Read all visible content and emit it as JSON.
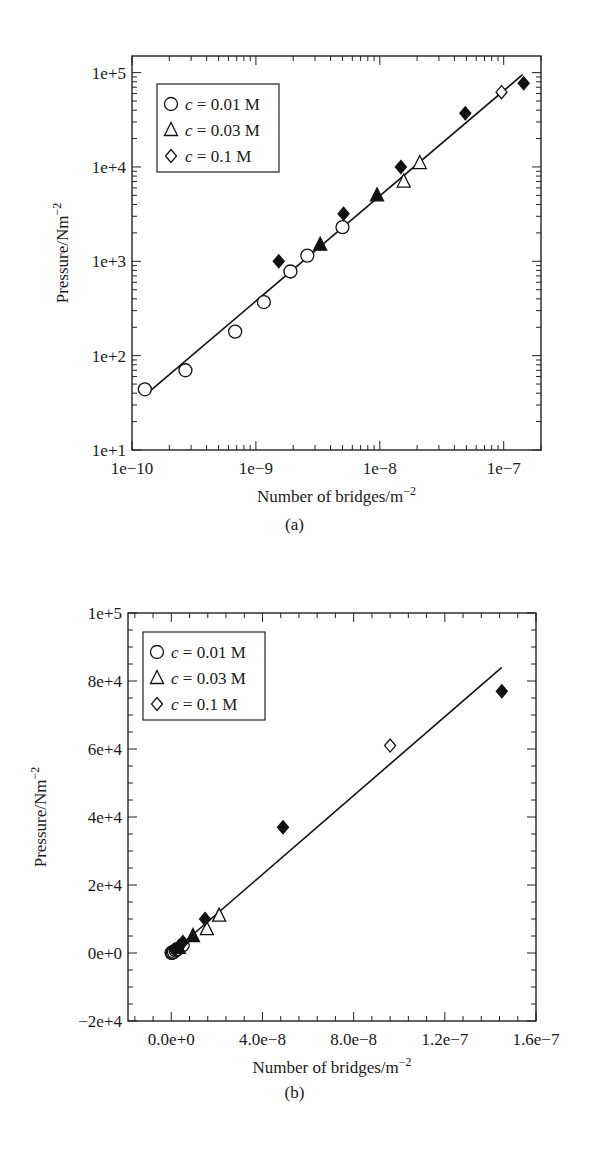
{
  "chart_data": [
    {
      "id": "a",
      "caption": "(a)",
      "type": "scatter",
      "xscale": "log",
      "yscale": "log",
      "xlabel": "Number of bridges/m",
      "xlabel_sup": "−2",
      "ylabel": "Pressure/Nm",
      "ylabel_sup": "−2",
      "xlim": [
        1e-10,
        2e-07
      ],
      "ylim": [
        10,
        150000
      ],
      "xticks": [
        {
          "value": 1e-10,
          "label": "1e−10"
        },
        {
          "value": 1e-09,
          "label": "1e−9"
        },
        {
          "value": 1e-08,
          "label": "1e−8"
        },
        {
          "value": 1e-07,
          "label": "1e−7"
        }
      ],
      "yticks": [
        {
          "value": 10,
          "label": "1e+1"
        },
        {
          "value": 100,
          "label": "1e+2"
        },
        {
          "value": 1000,
          "label": "1e+3"
        },
        {
          "value": 10000,
          "label": "1e+4"
        },
        {
          "value": 100000,
          "label": "1e+5"
        }
      ],
      "grid": false,
      "legend_position": "upper left",
      "legend": [
        {
          "marker": "circle-open",
          "label_italic": "c",
          "label": " = 0.01 M"
        },
        {
          "marker": "triangle-open",
          "label_italic": "c",
          "label": " = 0.03 M"
        },
        {
          "marker": "diamond-open",
          "label_italic": "c",
          "label": " = 0.1 M"
        }
      ],
      "series": [
        {
          "name": "c = 0.01 M",
          "marker": "circle-open",
          "x": [
            1.27e-10,
            2.7e-10,
            6.8e-10,
            1.16e-09,
            1.9e-09,
            2.6e-09,
            5e-09
          ],
          "y": [
            44,
            70,
            180,
            370,
            780,
            1150,
            2300
          ]
        },
        {
          "name": "c = 0.03 M",
          "marker": "triangle-open",
          "x": [
            1.56e-08,
            2.1e-08
          ],
          "y": [
            7000,
            11000
          ]
        },
        {
          "name": "c = 0.03 M (filled)",
          "marker": "triangle-filled",
          "x": [
            3.3e-09,
            9.5e-09
          ],
          "y": [
            1500,
            5000
          ]
        },
        {
          "name": "c = 0.1 M",
          "marker": "diamond-open",
          "x": [
            9.6e-08
          ],
          "y": [
            62000
          ]
        },
        {
          "name": "c = 0.1 M (filled)",
          "marker": "diamond-filled",
          "x": [
            1.53e-09,
            5.1e-09,
            1.48e-08,
            4.9e-08,
            1.45e-07
          ],
          "y": [
            1000,
            3200,
            10000,
            37000,
            77000
          ]
        }
      ],
      "fit_line": {
        "x": [
          1.27e-10,
          1.42e-07
        ],
        "y": [
          38,
          95000
        ]
      }
    },
    {
      "id": "b",
      "caption": "(b)",
      "type": "scatter",
      "xscale": "linear",
      "yscale": "linear",
      "xlabel": "Number of bridges/m",
      "xlabel_sup": "−2",
      "ylabel": "Pressure/Nm",
      "ylabel_sup": "−2",
      "xlim": [
        -1.9e-08,
        1.6e-07
      ],
      "ylim": [
        -20000,
        100000
      ],
      "xticks": [
        {
          "value": 0,
          "label": "0.0e+0"
        },
        {
          "value": 4e-08,
          "label": "4.0e−8"
        },
        {
          "value": 8e-08,
          "label": "8.0e−8"
        },
        {
          "value": 1.2e-07,
          "label": "1.2e−7"
        },
        {
          "value": 1.6e-07,
          "label": "1.6e−7"
        }
      ],
      "yticks": [
        {
          "value": -20000,
          "label": "−2e+4"
        },
        {
          "value": 0,
          "label": "0e+0"
        },
        {
          "value": 20000,
          "label": "2e+4"
        },
        {
          "value": 40000,
          "label": "4e+4"
        },
        {
          "value": 60000,
          "label": "6e+4"
        },
        {
          "value": 80000,
          "label": "8e+4"
        },
        {
          "value": 100000,
          "label": "1e+5"
        }
      ],
      "grid": false,
      "legend_position": "upper left",
      "legend": [
        {
          "marker": "circle-open",
          "label_italic": "c",
          "label": " = 0.01 M"
        },
        {
          "marker": "triangle-open",
          "label_italic": "c",
          "label": " = 0.03 M"
        },
        {
          "marker": "diamond-open",
          "label_italic": "c",
          "label": " = 0.1 M"
        }
      ],
      "series": [
        {
          "name": "c = 0.01 M",
          "marker": "circle-open",
          "x": [
            1.27e-10,
            2.7e-10,
            6.8e-10,
            1.16e-09,
            1.9e-09,
            2.6e-09,
            5e-09
          ],
          "y": [
            44,
            70,
            180,
            370,
            780,
            1150,
            2300
          ]
        },
        {
          "name": "c = 0.03 M",
          "marker": "triangle-open",
          "x": [
            1.56e-08,
            2.1e-08
          ],
          "y": [
            7000,
            11000
          ]
        },
        {
          "name": "c = 0.03 M (filled)",
          "marker": "triangle-filled",
          "x": [
            3.3e-09,
            9.5e-09
          ],
          "y": [
            1500,
            5000
          ]
        },
        {
          "name": "c = 0.1 M",
          "marker": "diamond-open",
          "x": [
            9.6e-08
          ],
          "y": [
            61000
          ]
        },
        {
          "name": "c = 0.1 M (filled)",
          "marker": "diamond-filled",
          "x": [
            1.53e-09,
            5.1e-09,
            1.48e-08,
            4.9e-08,
            1.45e-07
          ],
          "y": [
            1000,
            3200,
            10000,
            37000,
            77000
          ]
        }
      ],
      "fit_line": {
        "x": [
          1.27e-10,
          1.45e-07
        ],
        "y": [
          0,
          84000
        ]
      }
    }
  ]
}
